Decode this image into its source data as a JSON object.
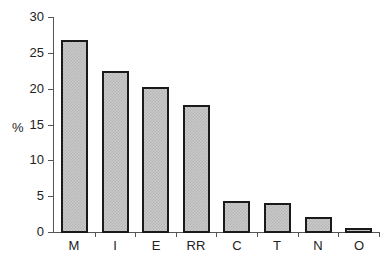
{
  "chart_data": {
    "type": "bar",
    "title": "",
    "xlabel": "",
    "ylabel": "%",
    "ylim": [
      0,
      30
    ],
    "yticks": [
      0,
      5,
      10,
      15,
      20,
      25,
      30
    ],
    "grid": false,
    "legend": null,
    "categories": [
      "M",
      "I",
      "E",
      "RR",
      "C",
      "T",
      "N",
      "O"
    ],
    "values": [
      26.8,
      22.5,
      20.2,
      17.7,
      4.3,
      4.1,
      2.1,
      0.6
    ]
  },
  "axis": {
    "y_title": "%",
    "y_tick_labels": [
      "0",
      "5",
      "10",
      "15",
      "20",
      "25",
      "30"
    ]
  },
  "colors": {
    "bar_fill": "#c9c9c9",
    "bar_border": "#1a1a1a",
    "axis": "#555555"
  }
}
